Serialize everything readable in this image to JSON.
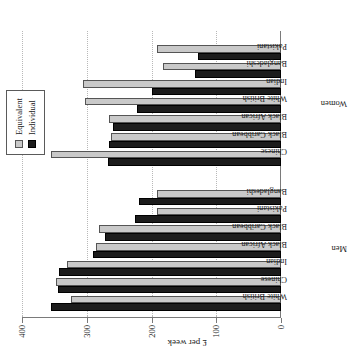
{
  "chart_data": {
    "type": "bar",
    "title": "",
    "subtitle": "",
    "xlabel": "",
    "ylabel": "£ per week",
    "ylim": [
      0,
      400
    ],
    "yticks": [
      0,
      100,
      200,
      300,
      400
    ],
    "ytick_labels": [
      "0",
      "100",
      "200",
      "300",
      "400"
    ],
    "grid": true,
    "legend_position": "top-right",
    "orientation": "rotated-90-vertical-bars",
    "legend": [
      "Equivalent",
      "Individual"
    ],
    "group_labels": [
      "Men",
      "Women"
    ],
    "categories": [
      "White British",
      "Chinese",
      "Indian",
      "Black African",
      "Black Caribbean",
      "Pakistani",
      "Bangladeshi",
      "Chinese",
      "Black Caribbean",
      "Black African",
      "White British",
      "Indian",
      "Bangladeshi",
      "Pakistani"
    ],
    "groups": [
      {
        "name": "Men",
        "categories": [
          "White British",
          "Chinese",
          "Indian",
          "Black African",
          "Black Caribbean",
          "Pakistani",
          "Bangladeshi"
        ],
        "series": [
          {
            "name": "Individual",
            "values": [
              355,
              345,
              343,
              290,
              272,
              225,
              220
            ]
          },
          {
            "name": "Equivalent",
            "values": [
              325,
              348,
              330,
              285,
              281,
              192,
              191
            ]
          }
        ]
      },
      {
        "name": "Women",
        "categories": [
          "Chinese",
          "Black Caribbean",
          "Black African",
          "White British",
          "Indian",
          "Bangladeshi",
          "Pakistani"
        ],
        "series": [
          {
            "name": "Individual",
            "values": [
              267,
              266,
              259,
              222,
              200,
              133,
              128
            ]
          },
          {
            "name": "Equivalent",
            "values": [
              355,
              263,
              266,
              303,
              306,
              183,
              192
            ]
          }
        ]
      }
    ],
    "series": [
      {
        "name": "Individual",
        "color": "#1c1c1c",
        "values": [
          355,
          345,
          343,
          290,
          272,
          225,
          220,
          267,
          266,
          259,
          222,
          200,
          133,
          128
        ]
      },
      {
        "name": "Equivalent",
        "color": "#c9c9c9",
        "values": [
          325,
          348,
          330,
          285,
          281,
          192,
          191,
          355,
          263,
          266,
          303,
          306,
          183,
          192
        ]
      }
    ]
  },
  "colors": {
    "individual": "#1c1c1c",
    "equivalent": "#c9c9c9",
    "axis": "#7a7a7a",
    "grid": "#b8b8b8",
    "background": "#ffffff"
  }
}
